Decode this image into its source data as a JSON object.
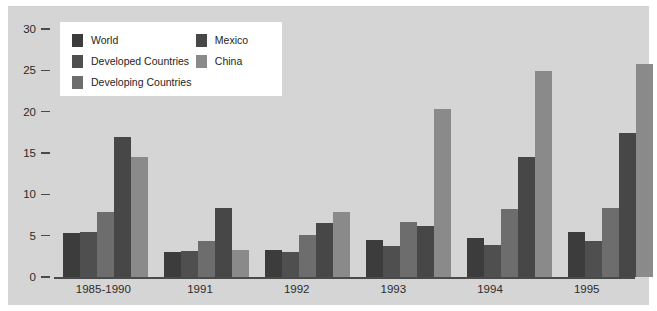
{
  "chart_data": {
    "type": "bar",
    "title": "",
    "subtitle": "",
    "xlabel": "",
    "ylabel": "",
    "ylim": [
      0,
      30
    ],
    "yticks": [
      0,
      5,
      10,
      15,
      20,
      25,
      30
    ],
    "ytick_labels": [
      "0",
      "5",
      "10",
      "15",
      "20",
      "25",
      "30"
    ],
    "grid": false,
    "legend_position": "top-left inside plot",
    "categories": [
      "1985-1990",
      "1991",
      "1992",
      "1993",
      "1994",
      "1995"
    ],
    "series": [
      {
        "name": "World",
        "color": "#3c3c3c",
        "values": [
          5.3,
          3.0,
          3.3,
          4.5,
          4.7,
          5.4
        ]
      },
      {
        "name": "Developed Countries",
        "color": "#4f4f4f",
        "values": [
          5.4,
          3.1,
          3.0,
          3.8,
          3.9,
          4.3
        ]
      },
      {
        "name": "Developing Countries",
        "color": "#6d6d6d",
        "values": [
          7.9,
          4.4,
          5.1,
          6.6,
          8.2,
          8.3
        ]
      },
      {
        "name": "Mexico",
        "color": "#474747",
        "values": [
          16.9,
          8.4,
          6.5,
          6.2,
          14.5,
          17.4
        ]
      },
      {
        "name": "China",
        "color": "#8a8a8a",
        "values": [
          14.5,
          3.3,
          7.9,
          20.3,
          24.9,
          25.8
        ]
      }
    ]
  },
  "legend": {
    "left_items": [
      {
        "label": "World",
        "swatch_name": "legend-swatch-world"
      },
      {
        "label": "Developed Countries",
        "swatch_name": "legend-swatch-developed-countries"
      },
      {
        "label": "Developing Countries",
        "swatch_name": "legend-swatch-developing-countries"
      }
    ],
    "right_items": [
      {
        "label": "Mexico",
        "swatch_name": "legend-swatch-mexico"
      },
      {
        "label": "China",
        "swatch_name": "legend-swatch-china"
      }
    ]
  },
  "colors": {
    "figure_background": "#d5d5d5",
    "legend_background": "#ffffff",
    "axis": "#4a4a4a",
    "text": "#2b2b2b"
  }
}
